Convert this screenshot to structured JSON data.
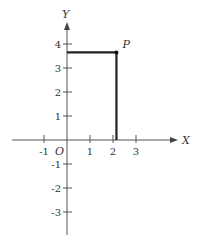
{
  "diagram": {
    "type": "coordinate-plane",
    "axes": {
      "x_label": "X",
      "y_label": "Y",
      "origin_label": "O",
      "x_ticks": [
        {
          "value": -1,
          "label": "-1"
        },
        {
          "value": 1,
          "label": "1"
        },
        {
          "value": 2,
          "label": "2"
        },
        {
          "value": 3,
          "label": "3"
        }
      ],
      "y_ticks": [
        {
          "value": 4,
          "label": "4"
        },
        {
          "value": 3,
          "label": "3"
        },
        {
          "value": 2,
          "label": "2"
        },
        {
          "value": 1,
          "label": "1"
        },
        {
          "value": -1,
          "label": "-1"
        },
        {
          "value": -2,
          "label": "-2"
        },
        {
          "value": -3,
          "label": "-3"
        }
      ]
    },
    "point": {
      "label": "P",
      "x": 2.15,
      "y": 3.65
    },
    "projection_lines": [
      "horizontal from y-axis to P",
      "vertical from P to x-axis"
    ],
    "colors": {
      "axis": "#444444",
      "projection": "#222222",
      "text": "#333333"
    }
  }
}
